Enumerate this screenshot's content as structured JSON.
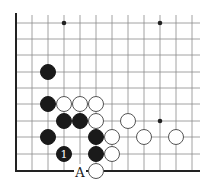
{
  "diagram": {
    "type": "go-board-corner",
    "corner": "bottom-left",
    "grid": {
      "origin_x": 16,
      "cell": 16,
      "columns_x": [
        16,
        32,
        48,
        64,
        80,
        96,
        112,
        128,
        144,
        160,
        176,
        192
      ],
      "rows_y": [
        23,
        39,
        55,
        72,
        88,
        104,
        121,
        137,
        154,
        171
      ],
      "right_extent": 200,
      "top_extent": 15,
      "bottom_edge_y": 171,
      "left_edge_x": 16
    },
    "star_points": [
      {
        "x": 64,
        "y": 23
      },
      {
        "x": 160,
        "y": 23
      },
      {
        "x": 160,
        "y": 121
      }
    ],
    "stone_radius": 7.5,
    "stones": [
      {
        "color": "black",
        "x": 48,
        "y": 72
      },
      {
        "color": "black",
        "x": 48,
        "y": 104
      },
      {
        "color": "white",
        "x": 64,
        "y": 104
      },
      {
        "color": "white",
        "x": 80,
        "y": 104
      },
      {
        "color": "white",
        "x": 96,
        "y": 104
      },
      {
        "color": "black",
        "x": 64,
        "y": 121
      },
      {
        "color": "black",
        "x": 80,
        "y": 121
      },
      {
        "color": "white",
        "x": 96,
        "y": 121
      },
      {
        "color": "white",
        "x": 128,
        "y": 121
      },
      {
        "color": "black",
        "x": 48,
        "y": 137
      },
      {
        "color": "black",
        "x": 96,
        "y": 137
      },
      {
        "color": "white",
        "x": 112,
        "y": 137
      },
      {
        "color": "white",
        "x": 144,
        "y": 137
      },
      {
        "color": "white",
        "x": 176,
        "y": 137
      },
      {
        "color": "black",
        "x": 64,
        "y": 154,
        "label": "1"
      },
      {
        "color": "black",
        "x": 96,
        "y": 154
      },
      {
        "color": "white",
        "x": 112,
        "y": 154
      },
      {
        "color": "white",
        "x": 96,
        "y": 171
      }
    ],
    "point_labels": [
      {
        "text": "A",
        "x": 80,
        "y": 171
      }
    ],
    "colors": {
      "black_stone": "#1a1a1a",
      "white_stone": "#ffffff",
      "white_stone_outline": "#555555",
      "grid": "#8a8a8a",
      "edge": "#222222",
      "background": "#ffffff"
    }
  }
}
